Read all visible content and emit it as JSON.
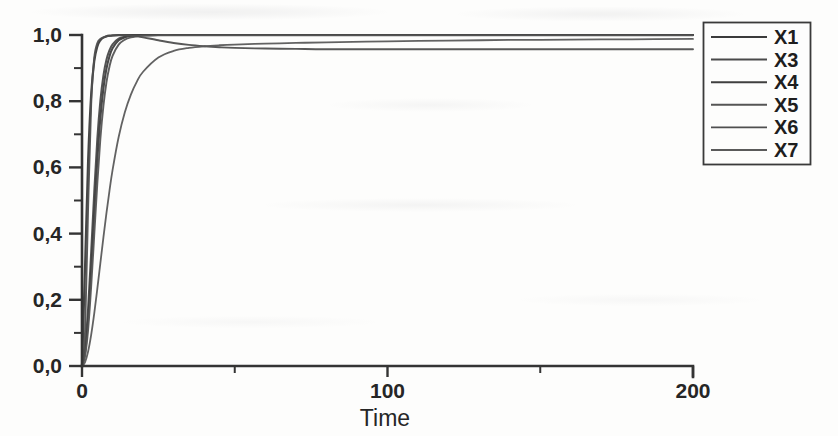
{
  "chart_data": {
    "type": "line",
    "title": "",
    "subtitle": "",
    "xlabel": "Time",
    "ylabel": "",
    "xlim": [
      0,
      200
    ],
    "ylim": [
      0.0,
      1.0
    ],
    "grid": false,
    "legend_position": "right-top",
    "x_ticks": [
      {
        "value": 0,
        "label": "0",
        "type": "major"
      },
      {
        "value": 50,
        "label": "",
        "type": "minor"
      },
      {
        "value": 100,
        "label": "100",
        "type": "major"
      },
      {
        "value": 150,
        "label": "",
        "type": "minor"
      },
      {
        "value": 200,
        "label": "200",
        "type": "major"
      }
    ],
    "y_ticks": [
      {
        "value": 1.0,
        "label": "1,0",
        "type": "major"
      },
      {
        "value": 0.9,
        "label": "",
        "type": "minor"
      },
      {
        "value": 0.8,
        "label": "0,8",
        "type": "major"
      },
      {
        "value": 0.7,
        "label": "",
        "type": "minor"
      },
      {
        "value": 0.6,
        "label": "0,6",
        "type": "major"
      },
      {
        "value": 0.5,
        "label": "",
        "type": "minor"
      },
      {
        "value": 0.4,
        "label": "0,4",
        "type": "major"
      },
      {
        "value": 0.3,
        "label": "",
        "type": "minor"
      },
      {
        "value": 0.2,
        "label": "0,2",
        "type": "major"
      },
      {
        "value": 0.1,
        "label": "",
        "type": "minor"
      },
      {
        "value": 0.0,
        "label": "0,0",
        "type": "major"
      }
    ],
    "x": [
      0,
      1,
      2,
      3,
      4,
      5,
      6,
      7,
      8,
      9,
      10,
      12,
      14,
      16,
      18,
      20,
      25,
      30,
      35,
      40,
      45,
      50,
      60,
      70,
      80,
      100,
      120,
      140,
      160,
      180,
      200
    ],
    "series": [
      {
        "name": "X1",
        "color": "#3b3b3b",
        "width": 2.2,
        "values": [
          0.0,
          0.3,
          0.62,
          0.82,
          0.92,
          0.965,
          0.984,
          0.992,
          0.996,
          0.998,
          0.999,
          1.0,
          1.0,
          1.0,
          1.0,
          1.0,
          1.0,
          1.0,
          1.0,
          1.0,
          1.0,
          1.0,
          1.0,
          1.0,
          1.0,
          1.0,
          1.0,
          1.0,
          1.0,
          1.0,
          1.0
        ]
      },
      {
        "name": "X3",
        "color": "#4a4a4a",
        "width": 2.0,
        "values": [
          0.0,
          0.055,
          0.175,
          0.345,
          0.525,
          0.685,
          0.8,
          0.877,
          0.925,
          0.954,
          0.972,
          0.989,
          0.995,
          0.998,
          0.999,
          1.0,
          1.0,
          1.0,
          1.0,
          1.0,
          1.0,
          1.0,
          1.0,
          1.0,
          1.0,
          1.0,
          1.0,
          1.0,
          1.0,
          1.0,
          1.0
        ]
      },
      {
        "name": "X4",
        "color": "#3f3f3f",
        "width": 2.1,
        "values": [
          0.0,
          0.04,
          0.14,
          0.29,
          0.46,
          0.62,
          0.748,
          0.838,
          0.898,
          0.936,
          0.96,
          0.984,
          0.993,
          0.997,
          0.999,
          0.999,
          1.0,
          1.0,
          1.0,
          1.0,
          1.0,
          1.0,
          1.0,
          1.0,
          1.0,
          1.0,
          1.0,
          1.0,
          1.0,
          1.0,
          1.0
        ]
      },
      {
        "name": "X5",
        "color": "#555555",
        "width": 1.9,
        "values": [
          0.0,
          0.03,
          0.11,
          0.24,
          0.395,
          0.55,
          0.685,
          0.785,
          0.857,
          0.905,
          0.937,
          0.971,
          0.986,
          0.993,
          0.996,
          0.998,
          0.999,
          0.999,
          0.999,
          0.999,
          0.999,
          0.999,
          0.999,
          0.999,
          0.999,
          0.999,
          0.999,
          0.999,
          0.999,
          0.999,
          0.999
        ]
      },
      {
        "name": "X6",
        "color": "#4f4f4f",
        "width": 1.9,
        "values": [
          0.0,
          0.105,
          0.48,
          0.79,
          0.93,
          0.975,
          0.988,
          0.993,
          0.996,
          0.997,
          0.998,
          0.999,
          0.999,
          0.998,
          0.996,
          0.993,
          0.984,
          0.976,
          0.97,
          0.966,
          0.963,
          0.961,
          0.959,
          0.958,
          0.957,
          0.957,
          0.957,
          0.957,
          0.957,
          0.957,
          0.957
        ]
      },
      {
        "name": "X7",
        "color": "#5a5a5a",
        "width": 1.8,
        "values": [
          0.0,
          0.012,
          0.044,
          0.094,
          0.158,
          0.232,
          0.31,
          0.388,
          0.462,
          0.53,
          0.592,
          0.692,
          0.766,
          0.82,
          0.86,
          0.889,
          0.932,
          0.952,
          0.961,
          0.966,
          0.969,
          0.971,
          0.974,
          0.976,
          0.978,
          0.981,
          0.983,
          0.985,
          0.986,
          0.987,
          0.988
        ]
      }
    ],
    "legend_entries": [
      {
        "label": "X1"
      },
      {
        "label": "X3"
      },
      {
        "label": "X4"
      },
      {
        "label": "X5"
      },
      {
        "label": "X6"
      },
      {
        "label": "X7"
      }
    ],
    "colors": {
      "axis": "#343434",
      "text": "#262626",
      "background": "#fdfdfc",
      "legend_border": "#3a3a3a"
    }
  }
}
